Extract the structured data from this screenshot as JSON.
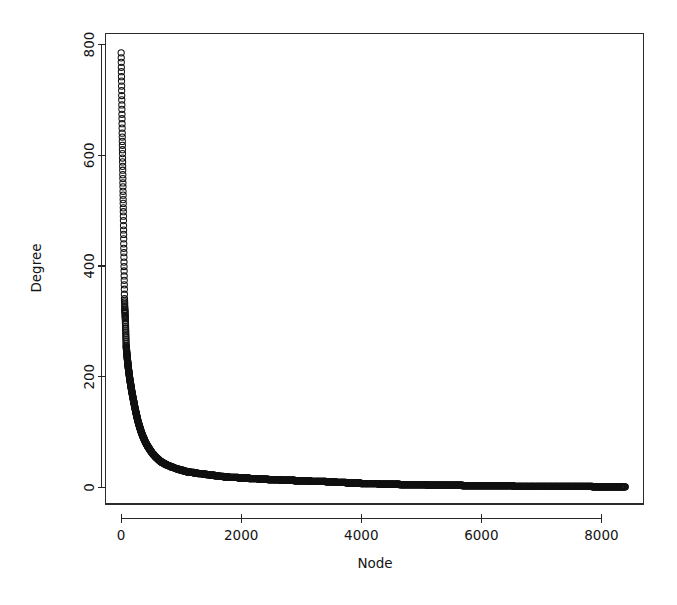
{
  "figure": {
    "kind": "scatter-plot",
    "background_color": "#ffffff",
    "foreground_color": "#111111",
    "width_px": 677,
    "height_px": 605
  },
  "chart_data": {
    "type": "scatter",
    "title": "",
    "subtitle": "",
    "xlabel": "Node",
    "ylabel": "Degree",
    "xlim": [
      -260,
      8700
    ],
    "ylim": [
      -30,
      820
    ],
    "xticks": [
      0,
      2000,
      4000,
      6000,
      8000
    ],
    "yticks": [
      0,
      200,
      400,
      600,
      800
    ],
    "xtick_labels": [
      "0",
      "2000",
      "4000",
      "6000",
      "8000"
    ],
    "ytick_labels": [
      "0",
      "200",
      "400",
      "600",
      "800"
    ],
    "grid": false,
    "legend": null,
    "legend_position": "none",
    "marker": "open-circle",
    "marker_size_px": 3.1,
    "marker_color": "#111111",
    "annotations": [],
    "series": [
      {
        "name": "degree-sequence",
        "description": "Rank-ordered node degree (heavy-tailed / power-law decay)",
        "n_points": 8400,
        "x_range": [
          1,
          8400
        ],
        "y_range": [
          1,
          785
        ],
        "points": [
          [
            1,
            785
          ],
          [
            18,
            640
          ],
          [
            38,
            490
          ],
          [
            56,
            341
          ],
          [
            62,
            322
          ],
          [
            70,
            305
          ],
          [
            84,
            256
          ],
          [
            90,
            248
          ],
          [
            96,
            241
          ],
          [
            102,
            234
          ],
          [
            108,
            228
          ],
          [
            114,
            222
          ],
          [
            120,
            216
          ],
          [
            126,
            211
          ],
          [
            132,
            206
          ],
          [
            138,
            201
          ],
          [
            144,
            196
          ],
          [
            150,
            192
          ],
          [
            156,
            188
          ],
          [
            162,
            184
          ],
          [
            168,
            180
          ],
          [
            174,
            176
          ],
          [
            180,
            172
          ],
          [
            186,
            169
          ],
          [
            192,
            165
          ],
          [
            198,
            162
          ],
          [
            205,
            158
          ],
          [
            212,
            154
          ],
          [
            219,
            150
          ],
          [
            226,
            146
          ],
          [
            234,
            142
          ],
          [
            242,
            138
          ],
          [
            250,
            134
          ],
          [
            258,
            130
          ],
          [
            267,
            126
          ],
          [
            276,
            122
          ],
          [
            286,
            118
          ],
          [
            296,
            114
          ],
          [
            307,
            110
          ],
          [
            318,
            106
          ],
          [
            330,
            102
          ],
          [
            343,
            98
          ],
          [
            357,
            94
          ],
          [
            372,
            90
          ],
          [
            388,
            86
          ],
          [
            405,
            82
          ],
          [
            424,
            78
          ],
          [
            445,
            74
          ],
          [
            468,
            70
          ],
          [
            493,
            66
          ],
          [
            521,
            62
          ],
          [
            552,
            58
          ],
          [
            587,
            54
          ],
          [
            626,
            50
          ],
          [
            670,
            46
          ],
          [
            720,
            43
          ],
          [
            778,
            40
          ],
          [
            845,
            37
          ],
          [
            922,
            34
          ],
          [
            1012,
            31
          ],
          [
            1118,
            28
          ],
          [
            1244,
            26
          ],
          [
            1395,
            24
          ],
          [
            1520,
            22
          ],
          [
            1668,
            20
          ],
          [
            1845,
            18
          ],
          [
            2060,
            17
          ],
          [
            2200,
            16
          ],
          [
            2360,
            15
          ],
          [
            2545,
            14
          ],
          [
            2760,
            13
          ],
          [
            3010,
            12
          ],
          [
            3300,
            11
          ],
          [
            3520,
            10
          ],
          [
            3640,
            9
          ],
          [
            3860,
            8
          ],
          [
            4120,
            7
          ],
          [
            4440,
            6
          ],
          [
            4840,
            5
          ],
          [
            5350,
            4
          ],
          [
            6020,
            3
          ],
          [
            6180,
            3
          ],
          [
            6900,
            2
          ],
          [
            7600,
            2
          ],
          [
            8100,
            1
          ],
          [
            8400,
            1
          ]
        ]
      }
    ]
  },
  "axes": {
    "x_axis": {
      "name": "Node",
      "label": "Node",
      "tick_labels": [
        "0",
        "2000",
        "4000",
        "6000",
        "8000"
      ]
    },
    "y_axis": {
      "name": "Degree",
      "label": "Degree",
      "label_rotation_deg": -90,
      "tick_labels": [
        "0",
        "200",
        "400",
        "600",
        "800"
      ],
      "tick_label_rotation_deg": -90
    }
  }
}
